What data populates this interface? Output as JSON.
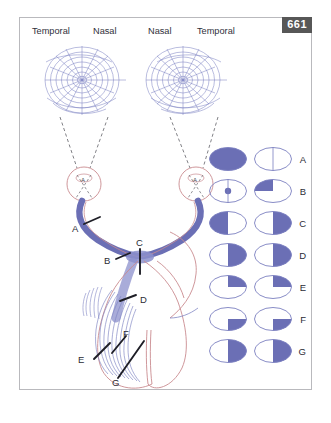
{
  "figure": {
    "number": "661",
    "accent_blue": "#6b6fb5",
    "outline_blue": "#7a7fc0",
    "outline_red": "#c98b90",
    "border_gray": "#b9b9bd",
    "badge_bg": "#575757"
  },
  "visual_fields": {
    "left_chart": {
      "outer_label": "Temporal",
      "inner_label": "Nasal",
      "name": "left-eye-perimetry-chart"
    },
    "right_chart": {
      "inner_label": "Nasal",
      "outer_label": "Temporal",
      "name": "right-eye-perimetry-chart"
    }
  },
  "lesion_labels": [
    {
      "id": "A",
      "label": "A",
      "site": "optic-nerve"
    },
    {
      "id": "B",
      "label": "B",
      "site": "optic-nerve-junction"
    },
    {
      "id": "C",
      "label": "C",
      "site": "optic-chiasm"
    },
    {
      "id": "D",
      "label": "D",
      "site": "optic-tract"
    },
    {
      "id": "E",
      "label": "E",
      "site": "optic-radiation-temporal"
    },
    {
      "id": "F",
      "label": "F",
      "site": "optic-radiation-parietal"
    },
    {
      "id": "G",
      "label": "G",
      "site": "optic-radiation-occipital"
    }
  ],
  "defect_rows": [
    {
      "letter": "A",
      "left_eye": {
        "pattern": "full",
        "description": "total field loss"
      },
      "right_eye": {
        "pattern": "none",
        "description": "normal field with midline"
      }
    },
    {
      "letter": "B",
      "left_eye": {
        "pattern": "central-scotoma",
        "description": "central scotoma"
      },
      "right_eye": {
        "pattern": "upper-left",
        "description": "upper nasal quadrant loss"
      }
    },
    {
      "letter": "C",
      "left_eye": {
        "pattern": "left-half",
        "description": "temporal hemianopia"
      },
      "right_eye": {
        "pattern": "right-half",
        "description": "temporal hemianopia"
      }
    },
    {
      "letter": "D",
      "left_eye": {
        "pattern": "right-half",
        "description": "homonymous hemianopia"
      },
      "right_eye": {
        "pattern": "right-half",
        "description": "homonymous hemianopia"
      }
    },
    {
      "letter": "E",
      "left_eye": {
        "pattern": "upper-right",
        "description": "superior quadrantanopia"
      },
      "right_eye": {
        "pattern": "upper-right",
        "description": "superior quadrantanopia"
      }
    },
    {
      "letter": "F",
      "left_eye": {
        "pattern": "lower-right",
        "description": "inferior quadrantanopia"
      },
      "right_eye": {
        "pattern": "lower-right",
        "description": "inferior quadrantanopia"
      }
    },
    {
      "letter": "G",
      "left_eye": {
        "pattern": "right-half",
        "description": "homonymous hemianopia macular sparing"
      },
      "right_eye": {
        "pattern": "right-half",
        "description": "homonymous hemianopia macular sparing"
      }
    }
  ]
}
